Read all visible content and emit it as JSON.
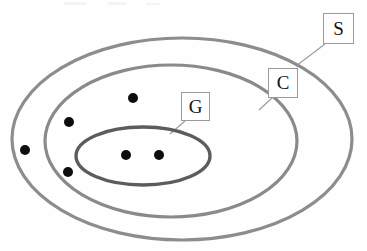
{
  "figure": {
    "type": "nested-set-venn-diagram",
    "background_color": "#fefefe",
    "width": 367,
    "height": 251
  },
  "sets": [
    {
      "id": "S",
      "label": "S",
      "role": "outermost-set",
      "stroke_color": "#8d8d8d",
      "stroke_width": 3.2,
      "fill": "none",
      "cx": 182,
      "cy": 139,
      "rx": 170,
      "ry": 101
    },
    {
      "id": "C",
      "label": "C",
      "role": "middle-set",
      "stroke_color": "#8a8a8a",
      "stroke_width": 3.2,
      "fill": "none",
      "cx": 171,
      "cy": 141,
      "rx": 126,
      "ry": 76
    },
    {
      "id": "G",
      "label": "G",
      "role": "innermost-set",
      "stroke_color": "#5c5c5c",
      "stroke_width": 3.4,
      "fill": "none",
      "cx": 143,
      "cy": 156,
      "rx": 67,
      "ry": 29
    }
  ],
  "labels": [
    {
      "id": "S",
      "text": "S",
      "box": {
        "left": 323,
        "top": 13,
        "width": 31,
        "height": 31
      },
      "leader": {
        "x1": 325,
        "y1": 44,
        "x2": 296,
        "y2": 66
      }
    },
    {
      "id": "C",
      "text": "C",
      "box": {
        "left": 268,
        "top": 68,
        "width": 30,
        "height": 30
      },
      "leader": {
        "x1": 272,
        "y1": 98,
        "x2": 259,
        "y2": 110
      }
    },
    {
      "id": "G",
      "text": "G",
      "box": {
        "left": 181,
        "top": 92,
        "width": 29,
        "height": 29
      },
      "leader": {
        "x1": 185,
        "y1": 121,
        "x2": 170,
        "y2": 134
      }
    }
  ],
  "points": [
    {
      "id": "p1",
      "cx": 25,
      "cy": 150,
      "r": 5.0,
      "color": "#0d0d0d",
      "region": "inside-S-outside-C"
    },
    {
      "id": "p2",
      "cx": 133,
      "cy": 98,
      "r": 5.0,
      "color": "#0d0d0d",
      "region": "inside-C-outside-G"
    },
    {
      "id": "p3",
      "cx": 69,
      "cy": 122,
      "r": 5.0,
      "color": "#0d0d0d",
      "region": "inside-C-outside-G"
    },
    {
      "id": "p4",
      "cx": 68,
      "cy": 172,
      "r": 5.0,
      "color": "#0d0d0d",
      "region": "inside-C-outside-G"
    },
    {
      "id": "p5",
      "cx": 126,
      "cy": 155,
      "r": 5.0,
      "color": "#0d0d0d",
      "region": "inside-G"
    },
    {
      "id": "p6",
      "cx": 159,
      "cy": 155,
      "r": 5.0,
      "color": "#0d0d0d",
      "region": "inside-G"
    }
  ],
  "leader_style": {
    "stroke_color": "#9d9d9d",
    "stroke_width": 1.2
  }
}
